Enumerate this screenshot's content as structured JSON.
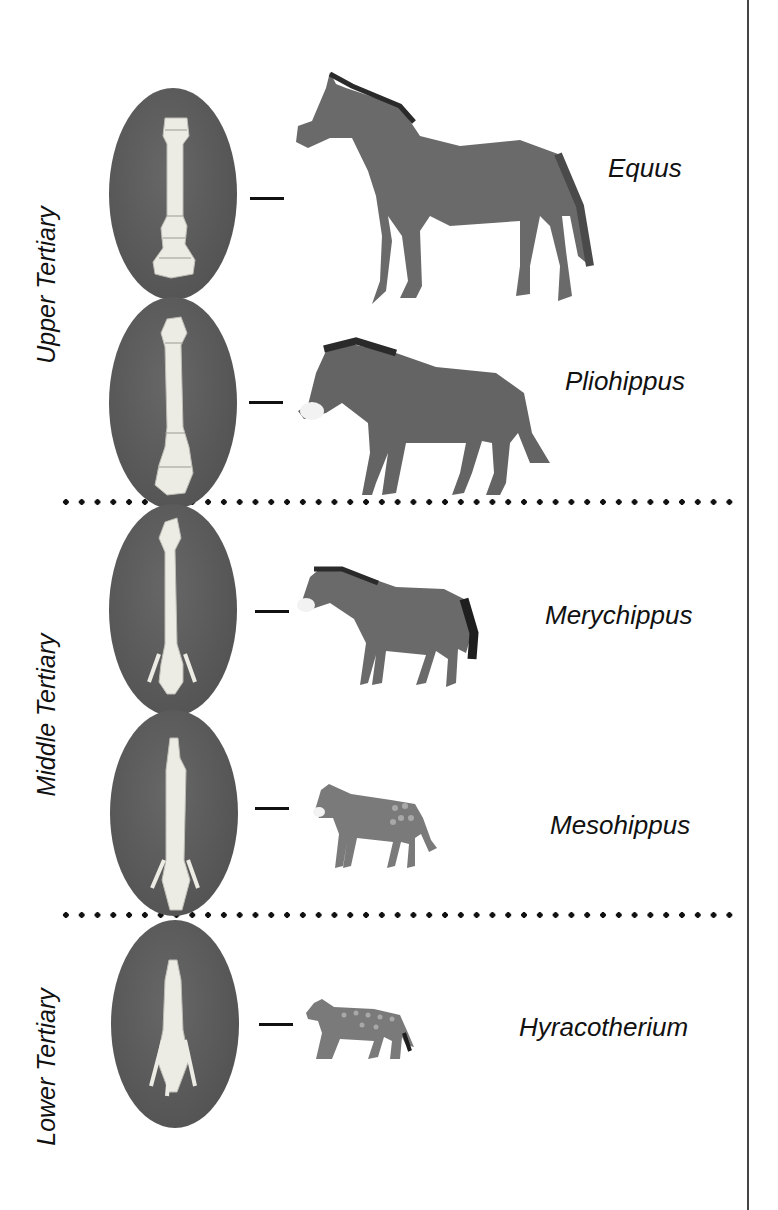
{
  "diagram": {
    "periods": [
      {
        "label": "Upper Tertiary",
        "center_y": 285
      },
      {
        "label": "Middle Tertiary",
        "center_y": 715
      },
      {
        "label": "Lower Tertiary",
        "center_y": 1065
      }
    ],
    "dividers": [
      {
        "y": 502
      },
      {
        "y": 915
      }
    ],
    "genera": [
      {
        "name": "Equus",
        "bone": "single-toe",
        "size": "large"
      },
      {
        "name": "Pliohippus",
        "bone": "single-toe",
        "size": "large"
      },
      {
        "name": "Merychippus",
        "bone": "three-toe-reduced",
        "size": "medium"
      },
      {
        "name": "Mesohippus",
        "bone": "three-toe",
        "size": "small"
      },
      {
        "name": "Hyracotherium",
        "bone": "four-toe",
        "size": "small"
      }
    ],
    "colors": {
      "oval": "#5c5c5c",
      "bone": "#ecebe4",
      "ink": "#111111",
      "horse_body": "#6a6a6a"
    }
  }
}
